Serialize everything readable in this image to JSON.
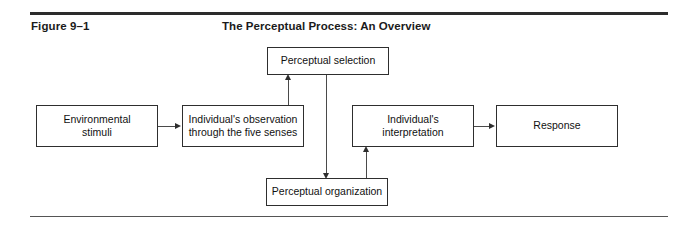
{
  "figure": {
    "label": "Figure 9–1",
    "title": "The Perceptual Process: An Overview"
  },
  "diagram": {
    "type": "flowchart",
    "nodes": [
      {
        "id": "environmental-stimuli",
        "line1": "Environmental",
        "line2": "stimuli"
      },
      {
        "id": "individual-observation",
        "line1": "Individual's observation",
        "line2": "through the five senses"
      },
      {
        "id": "perceptual-selection",
        "line1": "Perceptual selection",
        "line2": ""
      },
      {
        "id": "perceptual-organization",
        "line1": "Perceptual organization",
        "line2": ""
      },
      {
        "id": "individual-interpretation",
        "line1": "Individual's",
        "line2": "interpretation"
      },
      {
        "id": "response",
        "line1": "Response",
        "line2": ""
      }
    ],
    "edges": [
      {
        "from": "environmental-stimuli",
        "to": "individual-observation",
        "direction": "right"
      },
      {
        "from": "individual-observation",
        "to": "perceptual-selection",
        "direction": "up"
      },
      {
        "from": "perceptual-selection",
        "to": "perceptual-organization",
        "direction": "down"
      },
      {
        "from": "perceptual-organization",
        "to": "individual-interpretation",
        "direction": "up"
      },
      {
        "from": "individual-interpretation",
        "to": "response",
        "direction": "right"
      }
    ]
  },
  "colors": {
    "page_background": "#ffffff",
    "text": "#1b1b1b",
    "rule_top": "#2c2c2c",
    "rule_bottom": "#555555",
    "box_border": "#2e2e2e",
    "connector": "#4a4a4a"
  }
}
